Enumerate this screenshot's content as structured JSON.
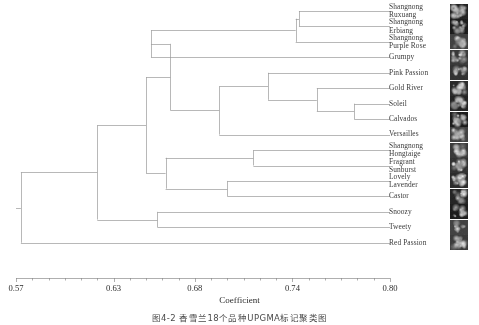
{
  "figure": {
    "kind": "dendrogram",
    "caption": "图4-2 香雪兰18个品种UPGMA标记聚类图"
  },
  "axis": {
    "title": "Coefficient",
    "ticks": [
      {
        "label": "0.57",
        "value": 0.57
      },
      {
        "label": "0.63",
        "value": 0.63
      },
      {
        "label": "0.68",
        "value": 0.68
      },
      {
        "label": "0.74",
        "value": 0.74
      },
      {
        "label": "0.80",
        "value": 0.8
      }
    ],
    "min": 0.57,
    "max": 0.8,
    "minor_tick_step": 0.01
  },
  "chart_data": {
    "type": "dendrogram",
    "title": "",
    "xlabel": "Coefficient",
    "ylabel": "",
    "xlim": [
      0.57,
      0.8
    ],
    "grid": false,
    "legend": "none",
    "line_color": "#9a9a9a",
    "leaves": [
      {
        "index": 0,
        "label": "Shangnong Ruxuang",
        "lines": [
          "Shangnong",
          "Ruxuang"
        ]
      },
      {
        "index": 1,
        "label": "Shangnong Erbiang",
        "lines": [
          "Shangnong",
          "Erbiang"
        ]
      },
      {
        "index": 2,
        "label": "Shangnong Purple Rose",
        "lines": [
          "Shangnong",
          "Purple Rose"
        ]
      },
      {
        "index": 3,
        "label": "Grumpy",
        "lines": [
          "Grumpy"
        ]
      },
      {
        "index": 4,
        "label": "Pink Passion",
        "lines": [
          "Pink Passion"
        ]
      },
      {
        "index": 5,
        "label": "Gold River",
        "lines": [
          "Gold River"
        ]
      },
      {
        "index": 6,
        "label": "Soleil",
        "lines": [
          "Soleil"
        ]
      },
      {
        "index": 7,
        "label": "Calvados",
        "lines": [
          "Calvados"
        ]
      },
      {
        "index": 8,
        "label": "Versailles",
        "lines": [
          "Versailles"
        ]
      },
      {
        "index": 9,
        "label": "Shangnong Hongtaige",
        "lines": [
          "Shangnong",
          "Hongtaige"
        ]
      },
      {
        "index": 10,
        "label": "Fragrant Sunburst",
        "lines": [
          "Fragrant",
          "Sunburst"
        ]
      },
      {
        "index": 11,
        "label": "Lovely Lavender",
        "lines": [
          "Lovely",
          "Lavender"
        ]
      },
      {
        "index": 12,
        "label": "Castor",
        "lines": [
          "Castor"
        ]
      },
      {
        "index": 13,
        "label": "Snoozy",
        "lines": [
          "Snoozy"
        ]
      },
      {
        "index": 14,
        "label": "Tweety",
        "lines": [
          "Tweety"
        ]
      },
      {
        "index": 15,
        "label": "Red Passion",
        "lines": [
          "Red Passion"
        ]
      }
    ],
    "merges": [
      {
        "id": "m1",
        "children": [
          0,
          1
        ],
        "coefficient": 0.744
      },
      {
        "id": "m2",
        "children": [
          "m1",
          2
        ],
        "coefficient": 0.742
      },
      {
        "id": "m3",
        "children": [
          "m2",
          3
        ],
        "coefficient": 0.653
      },
      {
        "id": "m4",
        "children": [
          6,
          7
        ],
        "coefficient": 0.778
      },
      {
        "id": "m5",
        "children": [
          5,
          "m4"
        ],
        "coefficient": 0.755
      },
      {
        "id": "m6",
        "children": [
          4,
          "m5"
        ],
        "coefficient": 0.725
      },
      {
        "id": "m7",
        "children": [
          "m6",
          8
        ],
        "coefficient": 0.695
      },
      {
        "id": "m8",
        "children": [
          "m3",
          "m7"
        ],
        "coefficient": 0.665
      },
      {
        "id": "m9",
        "children": [
          9,
          10
        ],
        "coefficient": 0.716
      },
      {
        "id": "m10",
        "children": [
          11,
          12
        ],
        "coefficient": 0.7
      },
      {
        "id": "m11",
        "children": [
          "m9",
          "m10"
        ],
        "coefficient": 0.662
      },
      {
        "id": "m12",
        "children": [
          "m8",
          "m11"
        ],
        "coefficient": 0.65
      },
      {
        "id": "m13",
        "children": [
          13,
          14
        ],
        "coefficient": 0.657
      },
      {
        "id": "m14",
        "children": [
          "m12",
          "m13"
        ],
        "coefficient": 0.62
      },
      {
        "id": "m15",
        "children": [
          "m14",
          15
        ],
        "coefficient": 0.573
      }
    ],
    "thumbnails_present": true,
    "thumbnail_count": 16,
    "thumbnail_style": "grayscale flower photographs"
  }
}
